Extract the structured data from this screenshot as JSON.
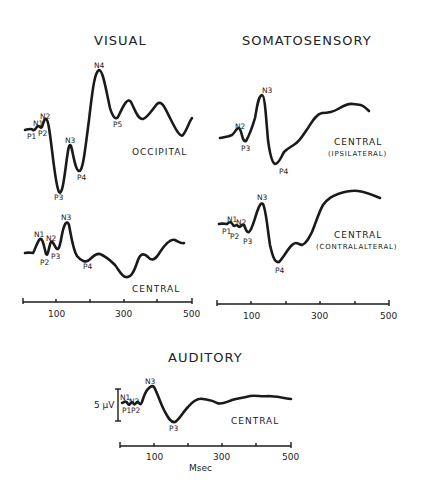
{
  "panels": {
    "visual": {
      "title": "VISUAL",
      "occipital": {
        "site": "OCCIPITAL",
        "peaks": [
          "N1",
          "P1",
          "N2",
          "P2",
          "P3",
          "N3",
          "P4",
          "N4",
          "P5"
        ]
      },
      "central": {
        "site": "CENTRAL",
        "peaks": [
          "N1",
          "P2",
          "N2",
          "P3",
          "N3",
          "P4"
        ]
      },
      "axis_ticks": [
        "100",
        "300",
        "500"
      ]
    },
    "somatosensory": {
      "title": "SOMATOSENSORY",
      "ipsilateral": {
        "site": "CENTRAL",
        "subsite": "(IPSILATERAL)",
        "peaks": [
          "N2",
          "P3",
          "N3",
          "P4"
        ]
      },
      "contralateral": {
        "site": "CENTRAL",
        "subsite": "(CONTRALALTERAL)",
        "peaks": [
          "P1",
          "N1",
          "P2",
          "N2",
          "P3",
          "N3",
          "P4"
        ]
      },
      "axis_ticks": [
        "100",
        "300",
        "500"
      ]
    },
    "auditory": {
      "title": "AUDITORY",
      "central": {
        "site": "CENTRAL",
        "peaks": [
          "N1",
          "P1",
          "N2",
          "P2",
          "N3",
          "P3"
        ]
      },
      "scale_bar": "5 µV",
      "axis_ticks": [
        "100",
        "300",
        "500"
      ],
      "xlabel": "Msec"
    }
  },
  "colors": {
    "trace": "#1a1a1a",
    "background": "#ffffff"
  }
}
